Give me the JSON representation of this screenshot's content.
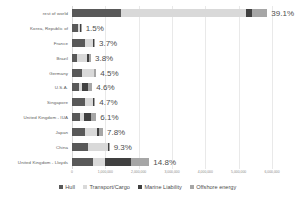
{
  "chart_data": {
    "type": "bar",
    "orientation": "horizontal",
    "stacked": true,
    "title": "",
    "xlabel": "",
    "ylabel": "",
    "grid": true,
    "legend_position": "bottom",
    "xlim": [
      0,
      6000000
    ],
    "xticks": [
      0,
      1000000,
      2000000,
      3000000,
      4000000,
      5000000,
      6000000
    ],
    "xtick_labels": [
      "0",
      "1,000,000",
      "2,000,000",
      "3,000,000",
      "4,000,000",
      "5,000,000",
      "6,000,000"
    ],
    "categories": [
      "rest of world",
      "Korea, Republic of",
      "France",
      "Brazil",
      "Germany",
      "U.S.A.",
      "Singapore",
      "United Kingdom - IUA",
      "Japan",
      "China",
      "United Kingdom - Lloyds"
    ],
    "series": [
      {
        "name": "Hull",
        "color": "#595959",
        "values": [
          1460000,
          190000,
          400000,
          150000,
          290000,
          200000,
          380000,
          250000,
          400000,
          480000,
          640000
        ]
      },
      {
        "name": "Transport/Cargo",
        "color": "#d9d9d9",
        "values": [
          3770000,
          40000,
          230000,
          310000,
          360000,
          110000,
          260000,
          110000,
          350000,
          600000,
          360000
        ]
      },
      {
        "name": "Marine Liability",
        "color": "#404040",
        "values": [
          170000,
          30000,
          20000,
          60000,
          20000,
          160000,
          20000,
          200000,
          50000,
          20000,
          760000
        ]
      },
      {
        "name": "Offshore energy",
        "color": "#a6a6a6",
        "values": [
          460000,
          30000,
          40000,
          50000,
          60000,
          140000,
          40000,
          170000,
          130000,
          30000,
          560000
        ]
      }
    ],
    "value_labels": [
      "39.1%",
      "1.5%",
      "3.7%",
      "3.8%",
      "4.5%",
      "4.6%",
      "4.7%",
      "6.1%",
      "7.8%",
      "9.3%",
      "14.8%"
    ],
    "totals": [
      5860000,
      290000,
      690000,
      570000,
      730000,
      610000,
      700000,
      730000,
      930000,
      1130000,
      2320000
    ]
  },
  "legend": {
    "items": [
      {
        "label": "Hull",
        "color": "#595959"
      },
      {
        "label": "Transport/Cargo",
        "color": "#d9d9d9"
      },
      {
        "label": "Marine Liability",
        "color": "#404040"
      },
      {
        "label": "Offshore energy",
        "color": "#a6a6a6"
      }
    ]
  }
}
